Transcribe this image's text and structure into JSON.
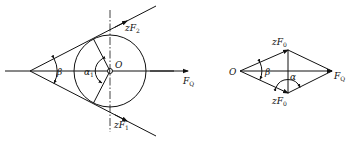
{
  "left_diagram": {
    "description": "Belt tensions on pulley: two tension forces tangent to circle, resultant along center line",
    "labels": {
      "center": "O",
      "upper_force": {
        "main": "zF",
        "sub": "2"
      },
      "lower_force": {
        "main": "zF",
        "sub": "1"
      },
      "resultant": {
        "main": "F",
        "sub": "Q"
      },
      "wedge_angle": "β",
      "wrap_angle": {
        "main": "α",
        "sub": "1"
      }
    }
  },
  "right_diagram": {
    "description": "Force parallelogram (rhombus) of two equal tensions summing to resultant",
    "labels": {
      "origin": "O",
      "upper_force": {
        "main": "zF",
        "sub": "0"
      },
      "lower_force": {
        "main": "zF",
        "sub": "0"
      },
      "resultant": {
        "main": "F",
        "sub": "Q"
      },
      "wedge_angle": "β",
      "angle_alpha": "α"
    }
  },
  "colors": {
    "ink": "#111111",
    "background": "#ffffff"
  }
}
